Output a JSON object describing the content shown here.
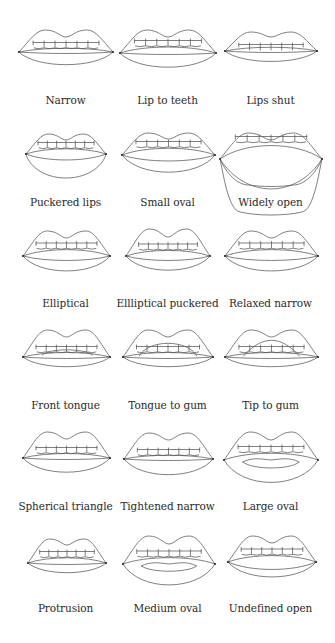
{
  "figure": {
    "items": [
      {
        "label": "Narrow",
        "shape": "narrow"
      },
      {
        "label": "Lip to teeth",
        "shape": "lip-to-teeth"
      },
      {
        "label": "Lips shut",
        "shape": "lips-shut"
      },
      {
        "label": "Puckered lips",
        "shape": "puckered-lips"
      },
      {
        "label": "Small oval",
        "shape": "small-oval"
      },
      {
        "label": "Widely open",
        "shape": "widely-open"
      },
      {
        "label": "Elliptical",
        "shape": "elliptical"
      },
      {
        "label": "Ellliptical puckered",
        "shape": "elliptical-puckered"
      },
      {
        "label": "Relaxed narrow",
        "shape": "relaxed-narrow"
      },
      {
        "label": "Front tongue",
        "shape": "front-tongue"
      },
      {
        "label": "Tongue to gum",
        "shape": "tongue-to-gum"
      },
      {
        "label": "Tip to gum",
        "shape": "tip-to-gum"
      },
      {
        "label": "Spherical triangle",
        "shape": "spherical-triangle"
      },
      {
        "label": "Tightened narrow",
        "shape": "tightened-narrow"
      },
      {
        "label": "Large oval",
        "shape": "large-oval"
      },
      {
        "label": "Protrusion",
        "shape": "protrusion"
      },
      {
        "label": "Medium oval",
        "shape": "medium-oval"
      },
      {
        "label": "Undefined open",
        "shape": "undefined-open"
      }
    ]
  }
}
